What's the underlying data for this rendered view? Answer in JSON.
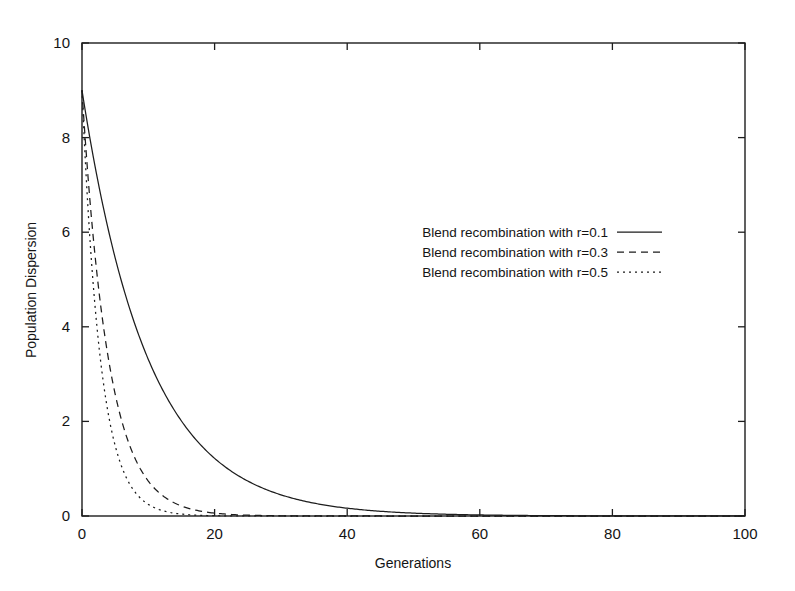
{
  "chart_data": {
    "type": "line",
    "title": "",
    "xlabel": "Generations",
    "ylabel": "Population Dispersion",
    "xlim": [
      0,
      100
    ],
    "ylim": [
      0,
      10
    ],
    "xticks": [
      0,
      20,
      40,
      60,
      80,
      100
    ],
    "yticks": [
      0,
      2,
      4,
      6,
      8,
      10
    ],
    "xtick_labels": [
      "0",
      "20",
      "40",
      "60",
      "80",
      "100"
    ],
    "ytick_labels": [
      "0",
      "2",
      "4",
      "6",
      "8",
      "10"
    ],
    "grid": false,
    "legend_position": "center-right",
    "frame": true,
    "tick_direction": "in",
    "series": [
      {
        "name": "Blend recombination with r=0.1",
        "style": "solid",
        "dash": "none",
        "color": "#1d1d1d",
        "initial_value": 9.0,
        "decay_rate": 0.1,
        "model": "y = 9.0 * exp(-0.1 * x)",
        "x": [
          0,
          2,
          4,
          6,
          8,
          10,
          12,
          14,
          16,
          18,
          20,
          25,
          30,
          35,
          40,
          45,
          50,
          55,
          60,
          70,
          80,
          90,
          100
        ],
        "values": [
          9.0,
          7.37,
          6.03,
          4.94,
          4.04,
          3.31,
          2.71,
          2.22,
          1.82,
          1.49,
          1.22,
          0.74,
          0.45,
          0.27,
          0.16,
          0.1,
          0.06,
          0.04,
          0.02,
          0.01,
          0.0,
          0.0,
          0.0
        ]
      },
      {
        "name": "Blend recombination with r=0.3",
        "style": "dashed",
        "dash": "7,5",
        "color": "#1d1d1d",
        "initial_value": 9.0,
        "decay_rate": 0.25,
        "model": "y = 9.0 * exp(-0.25 * x)",
        "x": [
          0,
          1,
          2,
          3,
          4,
          5,
          6,
          7,
          8,
          9,
          10,
          12,
          14,
          16,
          18,
          20,
          25,
          30,
          40,
          50,
          60,
          80,
          100
        ],
        "values": [
          9.0,
          7.01,
          5.46,
          4.25,
          3.31,
          2.58,
          2.01,
          1.56,
          1.22,
          0.95,
          0.74,
          0.45,
          0.27,
          0.16,
          0.1,
          0.06,
          0.02,
          0.005,
          0.0,
          0.0,
          0.0,
          0.0,
          0.0
        ]
      },
      {
        "name": "Blend recombination with r=0.5",
        "style": "dotted",
        "dash": "2,4",
        "color": "#1d1d1d",
        "initial_value": 9.0,
        "decay_rate": 0.36,
        "model": "y = 9.0 * exp(-0.36 * x)",
        "x": [
          0,
          1,
          2,
          3,
          4,
          5,
          6,
          7,
          8,
          9,
          10,
          12,
          14,
          16,
          18,
          20,
          25,
          30,
          40,
          50,
          60,
          80,
          100
        ],
        "values": [
          9.0,
          6.28,
          4.38,
          3.06,
          2.13,
          1.49,
          1.04,
          0.72,
          0.51,
          0.35,
          0.25,
          0.12,
          0.06,
          0.03,
          0.01,
          0.007,
          0.001,
          0.0,
          0.0,
          0.0,
          0.0,
          0.0,
          0.0
        ]
      }
    ],
    "legend_entries": [
      "Blend recombination with r=0.1",
      "Blend recombination with r=0.3",
      "Blend recombination with r=0.5"
    ]
  },
  "layout": {
    "plot_left": 82,
    "plot_right": 745,
    "plot_top": 43,
    "plot_bottom": 516,
    "legend_text_right": 608,
    "legend_line_start": 617,
    "legend_line_end": 662,
    "legend_first_row_y": 232,
    "legend_row_spacing": 20,
    "xlabel_x": 413,
    "xlabel_y": 568,
    "ylabel_x": 36,
    "ylabel_y": 290
  }
}
